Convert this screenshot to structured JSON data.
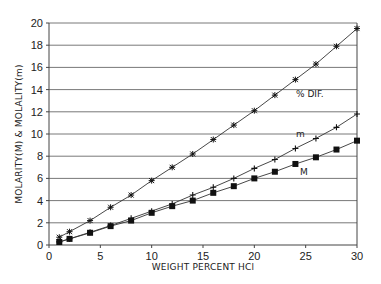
{
  "chart_data": {
    "type": "line",
    "title": "",
    "xlabel": "WEIGHT PERCENT HCl",
    "ylabel": "MOLARITY(M) & MOLALITY(m)",
    "xlim": [
      0,
      30
    ],
    "ylim": [
      0,
      20
    ],
    "x_ticks": [
      0,
      5,
      10,
      15,
      20,
      25,
      30
    ],
    "y_ticks": [
      0,
      2,
      4,
      6,
      8,
      10,
      12,
      14,
      16,
      18,
      20
    ],
    "grid": "horizontal",
    "legend": "inline labels",
    "x": [
      1,
      2,
      4,
      6,
      8,
      10,
      12,
      14,
      16,
      18,
      20,
      22,
      24,
      26,
      28,
      30
    ],
    "series": [
      {
        "name": "% DIF.",
        "marker": "asterisk",
        "values": [
          0.7,
          1.2,
          2.2,
          3.4,
          4.5,
          5.8,
          7.0,
          8.2,
          9.5,
          10.8,
          12.1,
          13.5,
          14.9,
          16.3,
          17.9,
          19.5
        ]
      },
      {
        "name": "m",
        "marker": "plus",
        "values": [
          0.28,
          0.56,
          1.14,
          1.75,
          2.4,
          3.05,
          3.7,
          4.5,
          5.2,
          6.0,
          6.9,
          7.7,
          8.7,
          9.6,
          10.6,
          11.8
        ]
      },
      {
        "name": "M",
        "marker": "square",
        "values": [
          0.27,
          0.55,
          1.1,
          1.7,
          2.2,
          2.9,
          3.5,
          4.0,
          4.7,
          5.3,
          6.0,
          6.6,
          7.3,
          7.9,
          8.6,
          9.4
        ]
      }
    ],
    "annotations": [
      {
        "text": "% DIF.",
        "x": 24.5,
        "y": 13.5
      },
      {
        "text": "m",
        "x": 22.5,
        "y": 10.2
      },
      {
        "text": "M",
        "x": 25,
        "y": 6.4
      }
    ]
  },
  "labels": {
    "xlabel": "WEIGHT PERCENT HCl",
    "ylabel": "MOLARITY(M) & MOLALITY(m)",
    "dif": "% DIF.",
    "m": "m",
    "M": "M"
  }
}
